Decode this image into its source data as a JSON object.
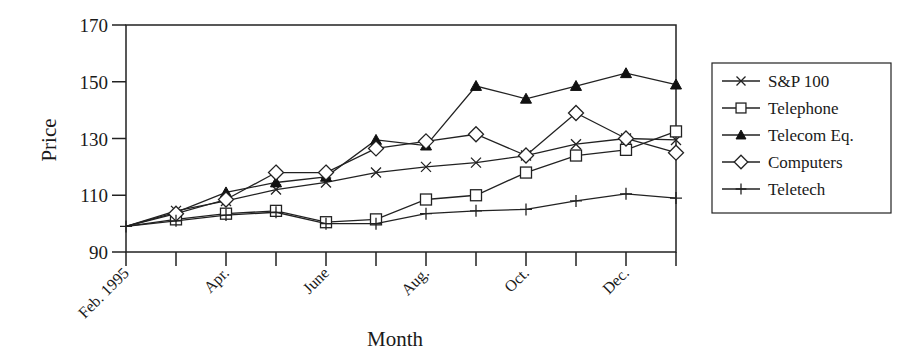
{
  "chart_data": {
    "type": "line",
    "title": "",
    "xlabel": "Month",
    "ylabel": "Price",
    "ylim": [
      90,
      170
    ],
    "yticks": [
      90,
      110,
      130,
      150,
      170
    ],
    "grid": false,
    "legend_position": "right",
    "x": [
      "Feb. 1995",
      "Mar.",
      "Apr.",
      "May",
      "June",
      "July",
      "Aug.",
      "Sep.",
      "Oct.",
      "Nov.",
      "Dec.",
      "Jan."
    ],
    "x_tick_labels": [
      "Feb. 1995",
      "",
      "Apr.",
      "",
      "June",
      "",
      "Aug.",
      "",
      "Oct.",
      "",
      "Dec.",
      ""
    ],
    "series": [
      {
        "name": "S&P 100",
        "marker": "x",
        "values": [
          99,
          104.5,
          108,
          112,
          114.5,
          118,
          120,
          121.5,
          124,
          128,
          130,
          129.5
        ]
      },
      {
        "name": "Telephone",
        "marker": "square",
        "values": [
          99,
          101.5,
          103.5,
          104.5,
          100.5,
          101.5,
          108.5,
          110,
          118,
          124,
          126,
          132.5
        ]
      },
      {
        "name": "Telecom Eq.",
        "marker": "triangle",
        "values": [
          99,
          104,
          111,
          114.5,
          116.5,
          129.5,
          127.5,
          148.5,
          144,
          148.5,
          153,
          149
        ]
      },
      {
        "name": "Computers",
        "marker": "diamond",
        "values": [
          99,
          103.5,
          108.5,
          118,
          118,
          126.5,
          129,
          131.5,
          124,
          139,
          130,
          125
        ]
      },
      {
        "name": "Teletech",
        "marker": "plus",
        "values": [
          99,
          101,
          103,
          104,
          100,
          100,
          103.5,
          104.5,
          105,
          108,
          110.5,
          109
        ]
      }
    ]
  },
  "legend": {
    "items": [
      {
        "label": "S&P 100",
        "marker": "x"
      },
      {
        "label": "Telephone",
        "marker": "square"
      },
      {
        "label": "Telecom Eq.",
        "marker": "triangle"
      },
      {
        "label": "Computers",
        "marker": "diamond"
      },
      {
        "label": "Teletech",
        "marker": "plus"
      }
    ]
  },
  "axes": {
    "x_title": "Month",
    "y_title": "Price"
  }
}
